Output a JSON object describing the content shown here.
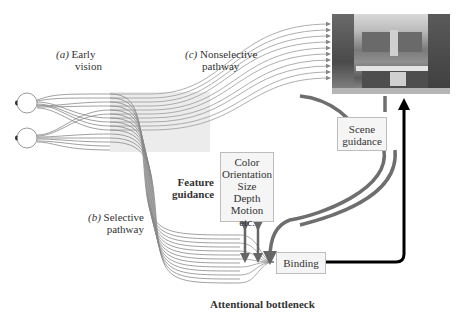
{
  "diagram": {
    "corner_text": "",
    "labels": {
      "early_vision": {
        "tag": "(a)",
        "line1": "Early",
        "line2": "vision"
      },
      "nonselective": {
        "tag": "(c)",
        "line1": "Nonselective",
        "line2": "pathway"
      },
      "selective": {
        "tag": "(b)",
        "line1": "Selective",
        "line2": "pathway"
      },
      "feature_guidance": {
        "line1": "Feature",
        "line2": "guidance"
      },
      "attentional_bottleneck": "Attentional bottleneck"
    },
    "feature_box": {
      "items": [
        "Color",
        "Orientation",
        "Size",
        "Depth",
        "Motion",
        "etc."
      ]
    },
    "scene_guidance_box": {
      "line1": "Scene",
      "line2": "guidance"
    },
    "binding_box": {
      "label": "Binding"
    },
    "image": {
      "subject": "kitchen-scene-photo"
    },
    "colors": {
      "pathway_lines": "#888888",
      "guidance_arrows": "#6e6e6e",
      "binding_arrow": "#000000",
      "box_fill": "#f5f5f5",
      "box_border": "#bdbdbd",
      "early_vision_band": "#ececec"
    }
  }
}
